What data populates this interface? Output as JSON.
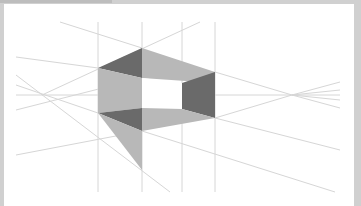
{
  "figure": {
    "type": "two-point perspective construction",
    "horizon_y": 95,
    "vanishing_points": [
      {
        "name": "left",
        "x": 42,
        "y": 95
      },
      {
        "name": "right",
        "x": 292,
        "y": 95
      }
    ],
    "vertical_guides_x": [
      98,
      142,
      182,
      215
    ],
    "colors": {
      "frame": "#d0d0d0",
      "background": "#ffffff",
      "guide": "#d8d8d8",
      "light_face": "#b8b8b8",
      "dark_face": "#6a6a6a"
    }
  }
}
